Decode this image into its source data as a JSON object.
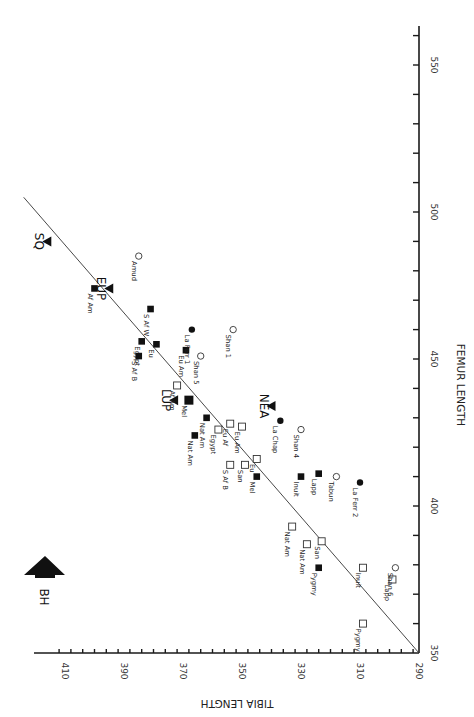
{
  "chart_data": {
    "type": "scatter",
    "title": "",
    "orientation_note": "figure printed rotated 90 degrees clockwise",
    "xlabel": "FEMUR LENGTH",
    "ylabel": "TIBIA LENGTH",
    "xlim": [
      350,
      560
    ],
    "ylim": [
      290,
      415
    ],
    "x_ticks": [
      350,
      400,
      450,
      500,
      550
    ],
    "y_ticks": [
      290,
      310,
      330,
      350,
      370,
      390,
      410
    ],
    "grid": false,
    "regression_line": {
      "from": {
        "femur": 350,
        "tibia": 290
      },
      "to": {
        "femur": 505,
        "tibia": 424
      }
    },
    "annotation": {
      "label": "BH",
      "symbol": "arrow-up"
    },
    "series": [
      {
        "name": "Fossil group means",
        "marker": "filled-triangle",
        "points": [
          {
            "label": "SQ",
            "femur": 490,
            "tibia": 416
          },
          {
            "label": "EUP",
            "femur": 474,
            "tibia": 395
          },
          {
            "label": "LUP",
            "femur": 436,
            "tibia": 373
          },
          {
            "label": "NEA",
            "femur": 434,
            "tibia": 340
          }
        ]
      },
      {
        "name": "Recent populations (males)",
        "marker": "filled-square",
        "points": [
          {
            "label": "Af Am",
            "femur": 474,
            "tibia": 400
          },
          {
            "label": "S Af W",
            "femur": 467,
            "tibia": 381
          },
          {
            "label": "Egypt",
            "femur": 456,
            "tibia": 384
          },
          {
            "label": "Eu",
            "femur": 455,
            "tibia": 379
          },
          {
            "label": "S Af B",
            "femur": 451,
            "tibia": 385
          },
          {
            "label": "Eu Am",
            "femur": 453,
            "tibia": 369
          },
          {
            "label": "Mel",
            "femur": 436,
            "tibia": 368
          },
          {
            "label": "Nat Am",
            "femur": 430,
            "tibia": 362
          },
          {
            "label": "Nat Am",
            "femur": 424,
            "tibia": 366
          },
          {
            "label": "Mel",
            "femur": 410,
            "tibia": 345
          },
          {
            "label": "Inuit",
            "femur": 410,
            "tibia": 330
          },
          {
            "label": "Lapp",
            "femur": 411,
            "tibia": 324
          },
          {
            "label": "Pygmy",
            "femur": 379,
            "tibia": 324
          }
        ]
      },
      {
        "name": "Recent populations (females)",
        "marker": "open-square",
        "points": [
          {
            "label": "Af Am",
            "femur": 441,
            "tibia": 372
          },
          {
            "label": "Egypt",
            "femur": 426,
            "tibia": 358
          },
          {
            "label": "Eu Af",
            "femur": 428,
            "tibia": 354
          },
          {
            "label": "Eu Am",
            "femur": 427,
            "tibia": 350
          },
          {
            "label": "S Af B",
            "femur": 414,
            "tibia": 354
          },
          {
            "label": "San",
            "femur": 414,
            "tibia": 349
          },
          {
            "label": "Eu",
            "femur": 416,
            "tibia": 345
          },
          {
            "label": "Nat Am",
            "femur": 393,
            "tibia": 333
          },
          {
            "label": "Nat Am",
            "femur": 387,
            "tibia": 328
          },
          {
            "label": "San",
            "femur": 388,
            "tibia": 323
          },
          {
            "label": "Inuit",
            "femur": 379,
            "tibia": 309
          },
          {
            "label": "Lapp",
            "femur": 375,
            "tibia": 299
          },
          {
            "label": "Pygmy",
            "femur": 360,
            "tibia": 309
          }
        ]
      },
      {
        "name": "Neandertal males",
        "marker": "filled-circle",
        "points": [
          {
            "label": "La Ferr 1",
            "femur": 460,
            "tibia": 367
          },
          {
            "label": "La Chap",
            "femur": 429,
            "tibia": 337
          },
          {
            "label": "La Ferr 2",
            "femur": 408,
            "tibia": 310
          }
        ]
      },
      {
        "name": "Neandertal females / other",
        "marker": "open-circle",
        "points": [
          {
            "label": "Amud",
            "femur": 485,
            "tibia": 385
          },
          {
            "label": "Shan 1",
            "femur": 460,
            "tibia": 353
          },
          {
            "label": "Shan 5",
            "femur": 451,
            "tibia": 364
          },
          {
            "label": "Shan 4",
            "femur": 426,
            "tibia": 330
          },
          {
            "label": "Tabun",
            "femur": 410,
            "tibia": 318
          },
          {
            "label": "Shan 6",
            "femur": 379,
            "tibia": 298
          }
        ]
      }
    ]
  },
  "labels": {
    "x_axis_title": "FEMUR LENGTH",
    "y_axis_title": "TIBIA LENGTH",
    "bh": "BH"
  }
}
